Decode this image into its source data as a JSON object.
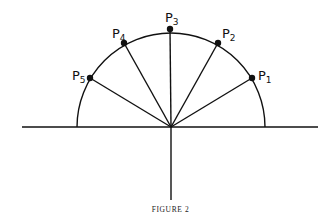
{
  "figure": {
    "caption": "FIGURE 2",
    "center": {
      "x": 171,
      "y": 127
    },
    "radius": 94,
    "axis": {
      "x1": 22,
      "x2": 318,
      "y_bottom": 200
    },
    "stroke_color": "#111111"
  },
  "points": [
    {
      "id": "P1",
      "base": "P",
      "sub": "1",
      "x": 252,
      "y": 78,
      "lx": 258,
      "ly": 80
    },
    {
      "id": "P2",
      "base": "P",
      "sub": "2",
      "x": 218,
      "y": 43,
      "lx": 222,
      "ly": 38
    },
    {
      "id": "P3",
      "base": "P",
      "sub": "3",
      "x": 170,
      "y": 29,
      "lx": 165,
      "ly": 22
    },
    {
      "id": "P4",
      "base": "P",
      "sub": "4",
      "x": 124,
      "y": 43,
      "lx": 112,
      "ly": 38
    },
    {
      "id": "P5",
      "base": "P",
      "sub": "5",
      "x": 90,
      "y": 78,
      "lx": 72,
      "ly": 80
    }
  ]
}
